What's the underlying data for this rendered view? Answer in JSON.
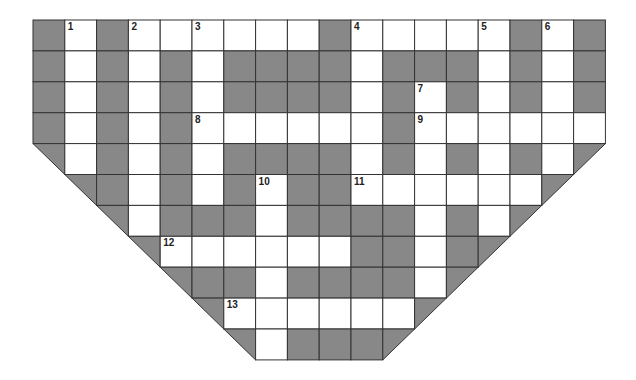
{
  "puzzle": {
    "type": "crossword",
    "shape": "inverted-trapezoid",
    "origin": {
      "x": 33,
      "y": 20
    },
    "cell_width": 31.8,
    "cell_height": 30.9,
    "cols": 18,
    "rows": 11,
    "colors": {
      "block": "#888888",
      "white": "#ffffff",
      "line": "#333333"
    },
    "legend": {
      "B": "block",
      "W": "white",
      "L": "left-edge diagonal block",
      "R": "right-edge diagonal block",
      "X": "outside"
    },
    "grid": [
      "BWBWWWWWWBWWWWWBWB",
      "BWBWBWBBBBWBBBWBWB",
      "BWBWBWBBBBWBWBWBWB",
      "BWBWBWWWWWWBWWWWWW",
      "LWBWBWBBBBWBWBWBWR",
      "XLBWBWBWBBWWWWWWRX",
      "XXLWBBBWBBBBWBWRXX",
      "XXXLWWWWWWBBWBRXXX",
      "XXXXLBBWBBBBWRXXXX",
      "XXXXXLWWWWWWRXXXXX",
      "XXXXXXLWBBBRXXXXXX"
    ],
    "numbers": [
      {
        "label": "1",
        "row": 0,
        "col": 1
      },
      {
        "label": "2",
        "row": 0,
        "col": 3
      },
      {
        "label": "3",
        "row": 0,
        "col": 5
      },
      {
        "label": "4",
        "row": 0,
        "col": 10
      },
      {
        "label": "5",
        "row": 0,
        "col": 14
      },
      {
        "label": "6",
        "row": 0,
        "col": 16
      },
      {
        "label": "7",
        "row": 2,
        "col": 12
      },
      {
        "label": "8",
        "row": 3,
        "col": 5
      },
      {
        "label": "9",
        "row": 3,
        "col": 12
      },
      {
        "label": "10",
        "row": 5,
        "col": 7
      },
      {
        "label": "11",
        "row": 5,
        "col": 10
      },
      {
        "label": "12",
        "row": 7,
        "col": 4
      },
      {
        "label": "13",
        "row": 9,
        "col": 6
      }
    ]
  }
}
